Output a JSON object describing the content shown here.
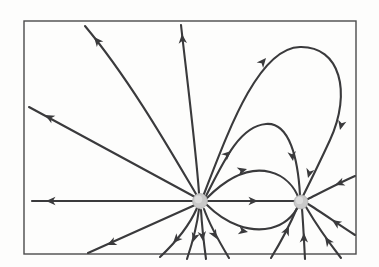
{
  "figure": {
    "type": "field-line-diagram",
    "canvas": {
      "width": 379,
      "height": 267
    },
    "background_color": "#fdfdfc",
    "line_color": "#3a3a3c",
    "frame_color": "#4a4a4c",
    "charge_fill_color": "#c9c9c9"
  },
  "frame": {
    "label": "diagram-border",
    "x": 24,
    "y": 21,
    "width": 332,
    "height": 233
  },
  "charges": [
    {
      "name": "positive-charge",
      "polarity": "positive",
      "symbol": "+",
      "cx": 200,
      "cy": 201,
      "r": 7.5,
      "flow": "source",
      "description": "Field lines radiate outward from this charge"
    },
    {
      "name": "negative-charge",
      "polarity": "negative",
      "symbol": "-",
      "cx": 301,
      "cy": 202,
      "r": 7.0,
      "flow": "sink",
      "description": "Field lines converge inward into this charge"
    }
  ],
  "field_lines": [
    {
      "id": "line-left-horizontal",
      "origin": "positive-charge",
      "terminus": "left-border",
      "direction": "outward-left",
      "path": "M 194 201 L 32 201",
      "arrows": [
        {
          "x": 46,
          "y": 201,
          "angle": 180
        }
      ]
    },
    {
      "id": "line-upper-left-diagonal",
      "origin": "positive-charge",
      "terminus": "left-border",
      "direction": "outward-upper-left",
      "path": "M 195 197 L 29 107",
      "arrows": [
        {
          "x": 45,
          "y": 115,
          "angle": 208
        }
      ]
    },
    {
      "id": "line-upper-left-curve",
      "origin": "positive-charge",
      "terminus": "top-border",
      "direction": "outward-up-left",
      "path": "M 196 194 C 170 150 130 80 85 26",
      "arrows": [
        {
          "x": 94,
          "y": 37,
          "angle": 230
        }
      ]
    },
    {
      "id": "line-top-vertical",
      "origin": "positive-charge",
      "terminus": "top-border",
      "direction": "outward-up",
      "path": "M 199 193 C 196 150 186 70 181 25",
      "arrows": [
        {
          "x": 182,
          "y": 34,
          "angle": 265
        }
      ]
    },
    {
      "id": "line-upper-right-to-negative",
      "origin": "positive-charge",
      "terminus": "negative-charge",
      "direction": "arc-over-top-large",
      "path": "M 204 194 C 228 132 258 48 300 47 C 340 46 352 92 330 140 C 318 166 308 186 303 196",
      "arrows": [
        {
          "x": 266,
          "y": 58,
          "angle": 310
        },
        {
          "x": 340,
          "y": 130,
          "angle": 104
        },
        {
          "x": 308,
          "y": 178,
          "angle": 105
        }
      ]
    },
    {
      "id": "line-mid-arc-to-negative",
      "origin": "positive-charge",
      "terminus": "negative-charge",
      "direction": "arc-over-top-medium",
      "path": "M 206 196 C 224 160 240 126 266 124 C 290 122 298 160 300 195",
      "arrows": [
        {
          "x": 231,
          "y": 151,
          "angle": 318
        },
        {
          "x": 293,
          "y": 161,
          "angle": 82
        }
      ]
    },
    {
      "id": "line-upper-inner-arc",
      "origin": "positive-charge",
      "terminus": "negative-charge",
      "direction": "arc-shallow-upper",
      "path": "M 207 198 C 228 177 250 167 270 172 C 286 176 295 188 299 199",
      "arrows": [
        {
          "x": 247,
          "y": 169,
          "angle": 344
        }
      ]
    },
    {
      "id": "line-straight-to-negative",
      "origin": "positive-charge",
      "terminus": "negative-charge",
      "direction": "horizontal-between-charges",
      "path": "M 208 201 L 294 201",
      "arrows": [
        {
          "x": 258,
          "y": 201,
          "angle": 0
        }
      ]
    },
    {
      "id": "line-lower-inner-arc",
      "origin": "positive-charge",
      "terminus": "negative-charge",
      "direction": "arc-shallow-lower",
      "path": "M 207 205 C 226 224 250 233 271 228 C 287 224 295 213 299 205",
      "arrows": [
        {
          "x": 248,
          "y": 232,
          "angle": 12
        }
      ]
    },
    {
      "id": "line-bottom-left-diagonal",
      "origin": "positive-charge",
      "terminus": "bottom-border",
      "direction": "outward-lower-left",
      "path": "M 195 205 L 88 253",
      "arrows": [
        {
          "x": 107,
          "y": 245,
          "angle": 156
        }
      ]
    },
    {
      "id": "line-bottom-left-steep",
      "origin": "positive-charge",
      "terminus": "bottom-border",
      "direction": "outward-down-left",
      "path": "M 197 208 C 190 224 176 242 160 257",
      "arrows": [
        {
          "x": 173,
          "y": 243,
          "angle": 133
        }
      ]
    },
    {
      "id": "line-bottom-down-left",
      "origin": "positive-charge",
      "terminus": "bottom-border",
      "direction": "outward-down",
      "path": "M 199 209 C 197 226 192 244 187 259",
      "arrows": [
        {
          "x": 193,
          "y": 242,
          "angle": 107
        }
      ]
    },
    {
      "id": "line-bottom-vertical",
      "origin": "positive-charge",
      "terminus": "bottom-border",
      "direction": "outward-straight-down",
      "path": "M 201 210 C 202 228 204 244 206 259",
      "arrows": [
        {
          "x": 203,
          "y": 241,
          "angle": 83
        }
      ]
    },
    {
      "id": "line-bottom-down-right",
      "origin": "positive-charge",
      "terminus": "bottom-border",
      "direction": "outward-down-right",
      "path": "M 204 209 C 210 226 220 243 229 258",
      "arrows": [
        {
          "x": 217,
          "y": 239,
          "angle": 60
        }
      ]
    },
    {
      "id": "line-neg-bottom-up-left",
      "origin": "bottom-border",
      "terminus": "negative-charge",
      "direction": "inward-from-bottom-left",
      "path": "M 271 258 C 282 240 292 220 297 208",
      "arrows": [
        {
          "x": 289,
          "y": 226,
          "angle": 295
        }
      ]
    },
    {
      "id": "line-neg-bottom-vertical",
      "origin": "bottom-border",
      "terminus": "negative-charge",
      "direction": "inward-from-bottom",
      "path": "M 305 259 C 304 240 303 220 302 209",
      "arrows": [
        {
          "x": 304,
          "y": 233,
          "angle": 271
        }
      ]
    },
    {
      "id": "line-neg-bottom-right",
      "origin": "bottom-border",
      "terminus": "negative-charge",
      "direction": "inward-from-bottom-right",
      "path": "M 341 258 C 327 240 313 219 306 207",
      "arrows": [
        {
          "x": 325,
          "y": 237,
          "angle": 235
        }
      ]
    },
    {
      "id": "line-neg-right-lower",
      "origin": "right-border",
      "terminus": "negative-charge",
      "direction": "inward-from-lower-right",
      "path": "M 355 235 C 338 224 318 210 308 204",
      "arrows": [
        {
          "x": 332,
          "y": 220,
          "angle": 213
        }
      ]
    },
    {
      "id": "line-neg-right-upper",
      "origin": "right-border",
      "terminus": "negative-charge",
      "direction": "inward-from-upper-right",
      "path": "M 355 176 C 339 183 318 194 308 199",
      "arrows": [
        {
          "x": 335,
          "y": 185,
          "angle": 159
        }
      ]
    }
  ],
  "annotations": {
    "caption": "",
    "legend_visible": false
  }
}
